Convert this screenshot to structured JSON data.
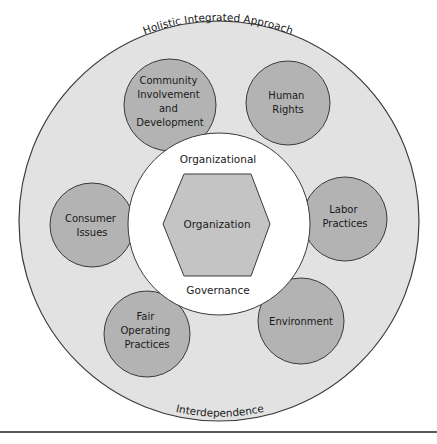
{
  "diagram": {
    "outer_ring": {
      "top_label": "Holistic Integrated Approach",
      "bottom_label": "Interdependence",
      "fill": "#e2e2e2"
    },
    "inner_circle": {
      "top_label": "Organizational",
      "bottom_label": "Governance",
      "fill": "#ffffff"
    },
    "center": {
      "label": "Organization",
      "fill": "#c4c4c4"
    },
    "core_subjects": [
      {
        "lines": [
          "Community",
          "Involvement",
          "and",
          "Development"
        ]
      },
      {
        "lines": [
          "Human",
          "Rights"
        ]
      },
      {
        "lines": [
          "Consumer",
          "Issues"
        ]
      },
      {
        "lines": [
          "Labor",
          "Practices"
        ]
      },
      {
        "lines": [
          "Fair",
          "Operating",
          "Practices"
        ]
      },
      {
        "lines": [
          "Environment"
        ]
      }
    ],
    "subject_fill": "#b3b3b3",
    "stroke": "#3a3a3a"
  }
}
